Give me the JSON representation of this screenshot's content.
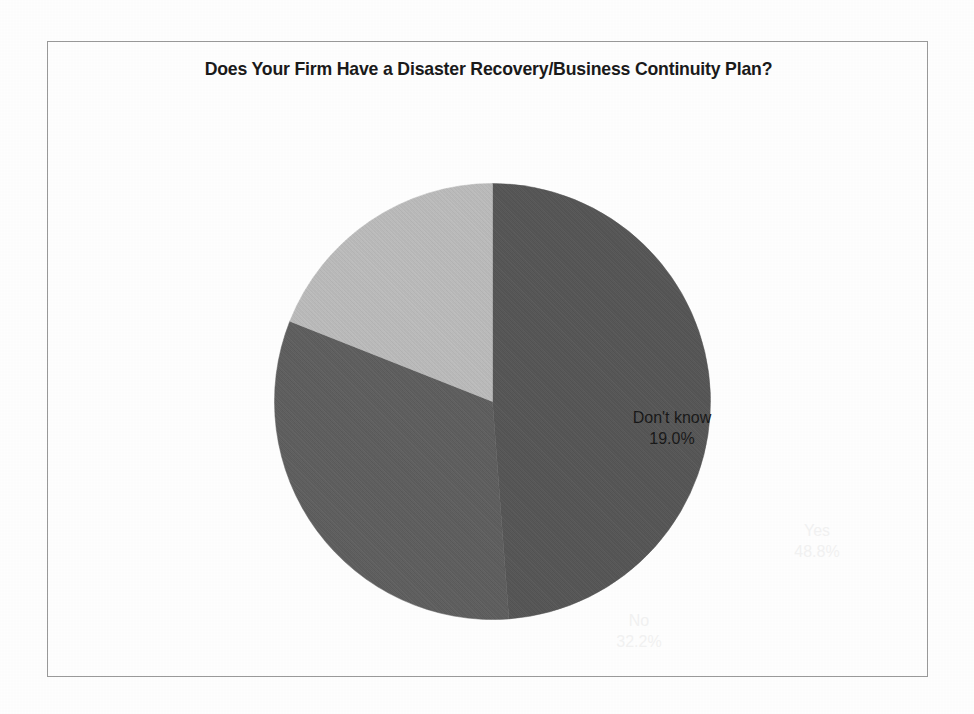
{
  "frame": {
    "border_color": "#9a9a9a",
    "background": "#fefefe"
  },
  "chart_data": {
    "type": "pie",
    "title": "Does Your Firm Have a Disaster Recovery/Business Continuity Plan?",
    "categories": [
      "Yes",
      "No",
      "Don't know"
    ],
    "values": [
      48.8,
      32.2,
      19.0
    ],
    "value_labels": [
      "48.8%",
      "32.2%",
      "19.0%"
    ],
    "unit": "percent",
    "start_angle_deg": 0,
    "direction": "clockwise",
    "legend": "none",
    "grid": false,
    "slices": [
      {
        "label": "Yes",
        "value": 48.8,
        "value_label": "48.8%",
        "color": "#555555",
        "text_color": "#f2f2f2"
      },
      {
        "label": "No",
        "value": 32.2,
        "value_label": "32.2%",
        "color": "#5e5e5e",
        "text_color": "#f2f2f2"
      },
      {
        "label": "Don't know",
        "value": 19.0,
        "value_label": "19.0%",
        "color": "#bdbdbd",
        "text_color": "#141414"
      }
    ]
  }
}
